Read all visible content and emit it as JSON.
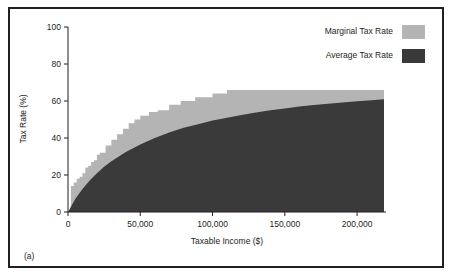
{
  "figure": {
    "panel_label": "(a)",
    "border_color": "#231f20",
    "background": "#ffffff"
  },
  "legend": {
    "position": "top-right",
    "entries": [
      {
        "label": "Marginal Tax Rate",
        "color": "#b4b4b4",
        "swatch": "legend-swatch-marginal"
      },
      {
        "label": "Average Tax Rate",
        "color": "#3a3a3a",
        "swatch": "legend-swatch-average"
      }
    ]
  },
  "chart_data": {
    "type": "area",
    "title": "",
    "subtitle": "",
    "xlabel": "Taxable Income ($)",
    "ylabel": "Tax Rate (%)",
    "xlim": [
      0,
      220000
    ],
    "ylim": [
      0,
      100
    ],
    "grid": false,
    "legend_position": "top-right",
    "xticks": [
      0,
      50000,
      100000,
      150000,
      200000
    ],
    "xticklabels": [
      "0",
      "50,000",
      "100,000",
      "150,000",
      "200,000"
    ],
    "yticks": [
      0,
      20,
      40,
      60,
      80,
      100
    ],
    "yticklabels": [
      "0",
      "20",
      "40",
      "60",
      "80",
      "100"
    ],
    "series": [
      {
        "name": "Marginal Tax Rate",
        "type": "step",
        "color": "#b4b4b4",
        "x": [
          0,
          2000,
          4000,
          6000,
          8000,
          10000,
          12000,
          14000,
          16000,
          18000,
          20000,
          22000,
          26000,
          30000,
          34000,
          38000,
          42000,
          46000,
          50000,
          56000,
          62000,
          70000,
          78000,
          88000,
          100000,
          110000,
          220000
        ],
        "values": [
          0,
          14,
          16,
          18,
          19,
          21,
          24,
          25,
          27,
          28,
          31,
          32,
          36,
          39,
          42,
          45,
          48,
          50,
          52,
          54,
          55,
          58,
          60,
          62,
          64,
          66,
          70
        ]
      },
      {
        "name": "Average Tax Rate",
        "type": "line",
        "color": "#3a3a3a",
        "x": [
          0,
          5000,
          10000,
          15000,
          20000,
          25000,
          30000,
          40000,
          50000,
          60000,
          70000,
          80000,
          90000,
          100000,
          110000,
          120000,
          130000,
          140000,
          150000,
          160000,
          170000,
          180000,
          190000,
          200000,
          210000,
          220000
        ],
        "values": [
          0,
          7,
          12.5,
          17,
          21,
          24.5,
          27.5,
          32.5,
          36.5,
          40,
          43,
          45.5,
          47.5,
          49.5,
          51,
          52.5,
          53.8,
          55,
          56,
          57,
          57.8,
          58.5,
          59.2,
          59.8,
          60.4,
          61
        ]
      }
    ]
  }
}
